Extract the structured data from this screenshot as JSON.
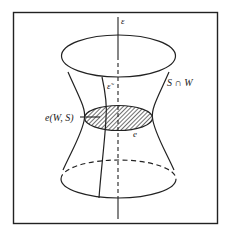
{
  "figure": {
    "colors": {
      "stroke": "#222222",
      "background": "#ffffff"
    },
    "labels": {
      "axis": "ε",
      "curve": "ε̃",
      "surface_intersection": "S ∩ W",
      "disk": "e(W, S)",
      "disk_short": "e"
    },
    "elements": {
      "frame": "rectangle border",
      "surface": "hyperboloid of one sheet",
      "hatched_disk": "shaded waist disk"
    }
  }
}
